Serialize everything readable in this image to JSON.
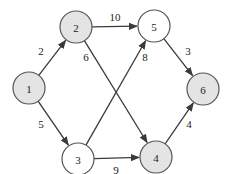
{
  "diagram": {
    "type": "directed-weighted-graph",
    "colors": {
      "filled": "#e4e4e4",
      "unfilled": "#ffffff",
      "stroke": "#555555",
      "edge": "#3a3a3a"
    },
    "nodes": [
      {
        "id": "1",
        "label": "1",
        "x": 29,
        "y": 88,
        "filled": true
      },
      {
        "id": "2",
        "label": "2",
        "x": 76,
        "y": 27,
        "filled": true
      },
      {
        "id": "3",
        "label": "3",
        "x": 78,
        "y": 159,
        "filled": false
      },
      {
        "id": "4",
        "label": "4",
        "x": 156,
        "y": 157,
        "filled": true
      },
      {
        "id": "5",
        "label": "5",
        "x": 154,
        "y": 26,
        "filled": false
      },
      {
        "id": "6",
        "label": "6",
        "x": 203,
        "y": 89,
        "filled": true
      }
    ],
    "edges": [
      {
        "from": "1",
        "to": "2",
        "weight": "2",
        "lx": 41,
        "ly": 51
      },
      {
        "from": "1",
        "to": "3",
        "weight": "5",
        "lx": 41,
        "ly": 124
      },
      {
        "from": "2",
        "to": "5",
        "weight": "10",
        "lx": 115,
        "ly": 17
      },
      {
        "from": "2",
        "to": "4",
        "weight": "6",
        "lx": 86,
        "ly": 57
      },
      {
        "from": "3",
        "to": "5",
        "weight": "8",
        "lx": 145,
        "ly": 57
      },
      {
        "from": "3",
        "to": "4",
        "weight": "9",
        "lx": 116,
        "ly": 170
      },
      {
        "from": "5",
        "to": "6",
        "weight": "3",
        "lx": 188,
        "ly": 51
      },
      {
        "from": "4",
        "to": "6",
        "weight": "4",
        "lx": 189,
        "ly": 124
      }
    ]
  }
}
